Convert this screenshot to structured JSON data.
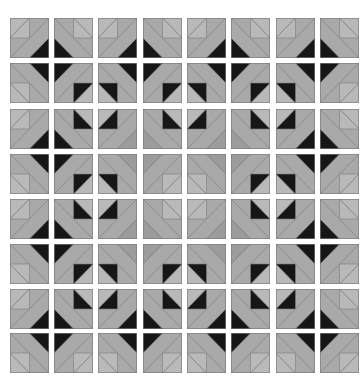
{
  "quilt": {
    "rows": 8,
    "cols": 8,
    "col_x": [
      10,
      54,
      98,
      143,
      187,
      231,
      276,
      320
    ],
    "row_y": [
      18,
      63,
      109,
      154,
      199,
      244,
      289,
      333
    ],
    "colors": {
      "base": "#a9a9a9",
      "light": "#b9b9b9",
      "dark_gray": "#9c9c9c",
      "black": "#161616",
      "line": "#7e7e7e"
    },
    "legend": "Each tile: corner = position of big triangle; big = big triangle color (K=black, G=gray); sq = small square inner half color (K=black, L=light)",
    "tiles": [
      [
        [
          "BR",
          "K",
          "L"
        ],
        [
          "BL",
          "K",
          "L"
        ],
        [
          "BR",
          "K",
          "L"
        ],
        [
          "BL",
          "K",
          "L"
        ],
        [
          "BR",
          "K",
          "L"
        ],
        [
          "BL",
          "K",
          "L"
        ],
        [
          "BR",
          "K",
          "L"
        ],
        [
          "BL",
          "K",
          "L"
        ]
      ],
      [
        [
          "TR",
          "K",
          "L"
        ],
        [
          "TL",
          "K",
          "K"
        ],
        [
          "TR",
          "K",
          "K"
        ],
        [
          "TL",
          "K",
          "K"
        ],
        [
          "TR",
          "K",
          "K"
        ],
        [
          "TL",
          "K",
          "K"
        ],
        [
          "TR",
          "K",
          "K"
        ],
        [
          "TL",
          "K",
          "L"
        ]
      ],
      [
        [
          "BR",
          "K",
          "L"
        ],
        [
          "BL",
          "K",
          "K"
        ],
        [
          "BR",
          "G",
          "K"
        ],
        [
          "BL",
          "G",
          "K"
        ],
        [
          "BR",
          "G",
          "K"
        ],
        [
          "BL",
          "G",
          "K"
        ],
        [
          "BR",
          "K",
          "K"
        ],
        [
          "BL",
          "K",
          "L"
        ]
      ],
      [
        [
          "TR",
          "K",
          "L"
        ],
        [
          "TL",
          "K",
          "K"
        ],
        [
          "TR",
          "G",
          "K"
        ],
        [
          "TL",
          "G",
          "L"
        ],
        [
          "TR",
          "G",
          "L"
        ],
        [
          "TL",
          "G",
          "K"
        ],
        [
          "TR",
          "K",
          "K"
        ],
        [
          "TL",
          "K",
          "L"
        ]
      ],
      [
        [
          "BR",
          "K",
          "L"
        ],
        [
          "BL",
          "K",
          "K"
        ],
        [
          "BR",
          "G",
          "K"
        ],
        [
          "BL",
          "G",
          "L"
        ],
        [
          "BR",
          "G",
          "L"
        ],
        [
          "BL",
          "G",
          "K"
        ],
        [
          "BR",
          "K",
          "K"
        ],
        [
          "BL",
          "K",
          "L"
        ]
      ],
      [
        [
          "TR",
          "K",
          "L"
        ],
        [
          "TL",
          "K",
          "K"
        ],
        [
          "TR",
          "G",
          "K"
        ],
        [
          "TL",
          "G",
          "K"
        ],
        [
          "TR",
          "G",
          "K"
        ],
        [
          "TL",
          "G",
          "K"
        ],
        [
          "TR",
          "K",
          "K"
        ],
        [
          "TL",
          "K",
          "L"
        ]
      ],
      [
        [
          "BR",
          "K",
          "L"
        ],
        [
          "BL",
          "K",
          "K"
        ],
        [
          "BR",
          "K",
          "K"
        ],
        [
          "BL",
          "K",
          "K"
        ],
        [
          "BR",
          "K",
          "K"
        ],
        [
          "BL",
          "K",
          "K"
        ],
        [
          "BR",
          "K",
          "K"
        ],
        [
          "BL",
          "K",
          "L"
        ]
      ],
      [
        [
          "TR",
          "K",
          "L"
        ],
        [
          "TL",
          "K",
          "L"
        ],
        [
          "TR",
          "K",
          "L"
        ],
        [
          "TL",
          "K",
          "L"
        ],
        [
          "TR",
          "K",
          "L"
        ],
        [
          "TL",
          "K",
          "L"
        ],
        [
          "TR",
          "K",
          "L"
        ],
        [
          "TL",
          "K",
          "L"
        ]
      ]
    ]
  }
}
